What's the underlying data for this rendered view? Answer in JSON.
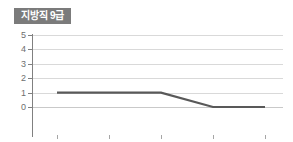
{
  "badge": {
    "label": "지방직 9급",
    "background": "#7b7b7b",
    "text_color": "#ffffff"
  },
  "colors": {
    "series_line": "#595959",
    "gridline": "#d9d9d9",
    "axis": "#808080",
    "tick_label": "#6e6e6e",
    "background": "#ffffff"
  },
  "chart_data": {
    "type": "line",
    "title": "지방직 9급",
    "xlabel": "",
    "ylabel": "",
    "categories": [
      "2018",
      "2019",
      "2020",
      "2021",
      "2022"
    ],
    "x": [
      2018,
      2019,
      2020,
      2021,
      2022
    ],
    "series": [
      {
        "name": "지방직 9급",
        "values": [
          1,
          1,
          1,
          0,
          0
        ]
      }
    ],
    "values": [
      1,
      1,
      1,
      0,
      0
    ],
    "ylim": [
      0,
      5
    ],
    "yticks": [
      0,
      1,
      2,
      3,
      4,
      5
    ],
    "ytick_labels": [
      "0",
      "1",
      "2",
      "3",
      "4",
      "5"
    ],
    "xtick_labels": [
      "2018",
      "2019",
      "2020",
      "2021",
      "2022"
    ],
    "grid": true,
    "grid_axis": "y",
    "legend": false,
    "legend_position": "none",
    "markers": false
  }
}
